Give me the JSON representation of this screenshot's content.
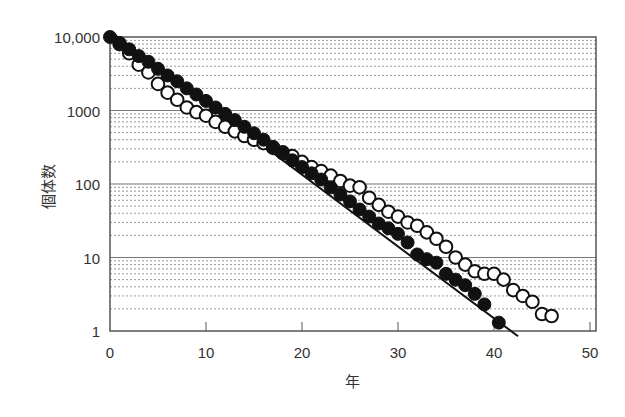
{
  "chart_data": {
    "type": "scatter",
    "title": "",
    "xlabel": "年",
    "ylabel": "個体数",
    "xlim": [
      0,
      50
    ],
    "ylim": [
      1,
      10000
    ],
    "yscale": "log",
    "grid": true,
    "x_ticks": [
      "0",
      "10",
      "20",
      "30",
      "40",
      "50"
    ],
    "y_ticks": [
      "1",
      "10",
      "100",
      "1000",
      "10,000"
    ],
    "legend": null,
    "series": [
      {
        "name": "filled-circles",
        "marker": "filled",
        "x": [
          0,
          1,
          2,
          3,
          4,
          5,
          6,
          7,
          8,
          9,
          10,
          11,
          12,
          13,
          14,
          15,
          16,
          17,
          18,
          19,
          20,
          21,
          22,
          23,
          24,
          25,
          26,
          27,
          28,
          29,
          30,
          31,
          32,
          33,
          34,
          35,
          36,
          37,
          38,
          39,
          40.5
        ],
        "y": [
          10000,
          8300,
          6800,
          5500,
          4600,
          3700,
          3000,
          2500,
          2000,
          1650,
          1350,
          1100,
          900,
          740,
          600,
          490,
          400,
          320,
          260,
          210,
          170,
          140,
          115,
          90,
          72,
          58,
          45,
          36,
          29,
          25,
          21,
          16,
          11,
          9.5,
          8.5,
          6,
          5,
          4.2,
          3.2,
          2.3,
          1.3
        ]
      },
      {
        "name": "open-circles",
        "marker": "open",
        "x": [
          1,
          2,
          3,
          4,
          5,
          6,
          7,
          8,
          9,
          10,
          11,
          12,
          13,
          14,
          15,
          16,
          17,
          18,
          19,
          20,
          21,
          22,
          23,
          24,
          25,
          26,
          27,
          28,
          29,
          30,
          31,
          32,
          33,
          34,
          35,
          36,
          37,
          38,
          39,
          40,
          41,
          42,
          43,
          44,
          45,
          46
        ],
        "y": [
          8000,
          6000,
          4200,
          3300,
          2300,
          1750,
          1400,
          1100,
          950,
          850,
          700,
          600,
          520,
          450,
          400,
          360,
          310,
          270,
          240,
          200,
          170,
          150,
          130,
          110,
          95,
          90,
          65,
          52,
          42,
          36,
          30,
          27,
          22,
          18,
          14,
          10,
          8,
          6.5,
          6,
          6,
          5,
          3.6,
          3,
          2.5,
          1.7,
          1.6
        ]
      }
    ],
    "trend_line": {
      "x": [
        0,
        42.5
      ],
      "y": [
        12000,
        0.85
      ]
    }
  }
}
